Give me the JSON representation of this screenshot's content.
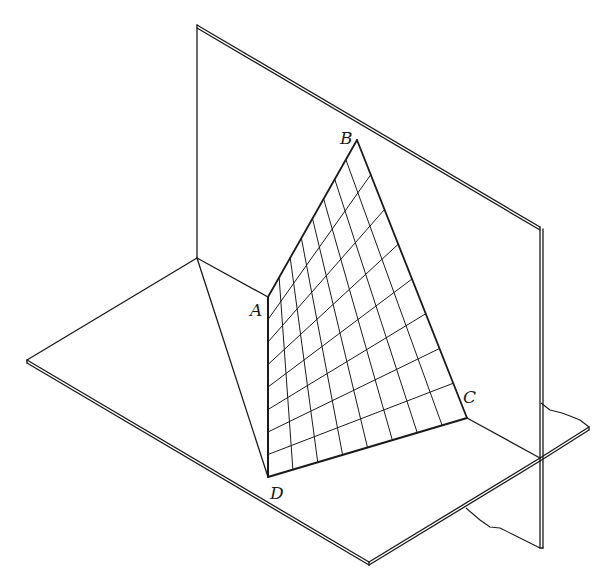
{
  "figure": {
    "type": "hyperbolic-paraboloid-between-perpendicular-planes",
    "width": 608,
    "height": 583,
    "stroke_color": "#1a1a1a",
    "background": "#ffffff"
  },
  "vertical_plane": {
    "top_left": [
      197,
      25
    ],
    "top_right": [
      540,
      227
    ],
    "bottom_left": [
      197,
      258
    ],
    "break_start": [
      541,
      403
    ],
    "bottom_right": [
      540,
      548
    ],
    "thickness": 3
  },
  "horizontal_plane": {
    "left": [
      27,
      360
    ],
    "back": [
      197,
      258
    ],
    "bottom": [
      369,
      562
    ],
    "right": [
      589,
      427
    ],
    "right_back": [
      541,
      403
    ],
    "crossing": [
      540,
      458
    ],
    "under_break": [
      [
        466,
        508
      ],
      [
        480,
        520
      ],
      [
        490,
        527
      ],
      [
        500,
        528
      ],
      [
        512,
        534
      ],
      [
        528,
        542
      ],
      [
        540,
        548
      ]
    ],
    "right_break": [
      [
        541,
        403
      ],
      [
        550,
        410
      ],
      [
        562,
        413
      ],
      [
        570,
        416
      ],
      [
        580,
        420
      ],
      [
        589,
        427
      ]
    ],
    "thickness": 3
  },
  "surface": {
    "A": [
      268,
      297
    ],
    "B": [
      357,
      140
    ],
    "C": [
      467,
      418
    ],
    "D": [
      268,
      477
    ],
    "divisions_ab": 8,
    "divisions_ad": 8
  },
  "labels": [
    {
      "text": "A",
      "x": 250,
      "y": 316
    },
    {
      "text": "B",
      "x": 340,
      "y": 144
    },
    {
      "text": "C",
      "x": 463,
      "y": 403
    },
    {
      "text": "D",
      "x": 270,
      "y": 499
    }
  ]
}
